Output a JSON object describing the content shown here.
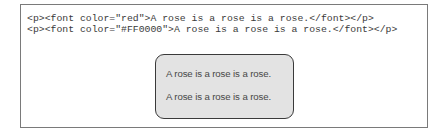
{
  "code_example": {
    "lines": [
      "<p><font color=\"red\">A rose is a rose is a rose.</font></p>",
      "<p><font color=\"#FF0000\">A rose is a rose is a rose.</font></p>"
    ]
  },
  "rendered_output": {
    "lines": [
      "A rose is a rose is a rose.",
      "A rose is a rose is a rose."
    ]
  },
  "colors": {
    "outer_border": "#7a7a7a",
    "render_box_fill": "#e3e3e3",
    "render_box_border": "#3a3a3a",
    "code_text": "#3a3a3a",
    "render_text": "#474747"
  }
}
